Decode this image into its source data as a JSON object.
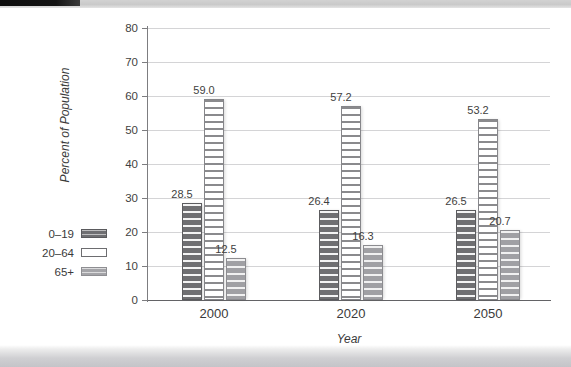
{
  "chart_data": {
    "type": "bar",
    "title": "",
    "xlabel": "Year",
    "ylabel": "Percent of Population",
    "categories": [
      "2000",
      "2020",
      "2050"
    ],
    "series": [
      {
        "name": "0–19",
        "values": [
          28.5,
          26.4,
          26.5
        ],
        "labels": [
          "28.5",
          "26.4",
          "26.5"
        ],
        "color": "#6f6f72",
        "swatch": "dark-gray-striped"
      },
      {
        "name": "20–64",
        "values": [
          59.0,
          57.2,
          53.2
        ],
        "labels": [
          "59.0",
          "57.2",
          "53.2"
        ],
        "color": "#ffffff",
        "swatch": "white-striped"
      },
      {
        "name": "65+",
        "values": [
          12.5,
          16.3,
          20.7
        ],
        "labels": [
          "12.5",
          "16.3",
          "20.7"
        ],
        "color": "#a0a0a4",
        "swatch": "medium-gray-striped"
      }
    ],
    "ylim": [
      0,
      80
    ],
    "yticks": [
      0,
      10,
      20,
      30,
      40,
      50,
      60,
      70,
      80
    ],
    "ytick_labels": [
      "0",
      "10",
      "20",
      "30",
      "40",
      "50",
      "60",
      "70",
      "80"
    ],
    "grid": true,
    "grid_axis": "y",
    "legend_position": "left-outside",
    "bar_labels_shown": true
  },
  "axes": {
    "y_title": "Percent of Population",
    "x_title": "Year"
  },
  "legend": {
    "items": [
      {
        "label": "0–19"
      },
      {
        "label": "20–64"
      },
      {
        "label": "65+"
      }
    ]
  },
  "page": {
    "background": "#ffffff",
    "scan_edge_color": "#c4c4c8"
  }
}
